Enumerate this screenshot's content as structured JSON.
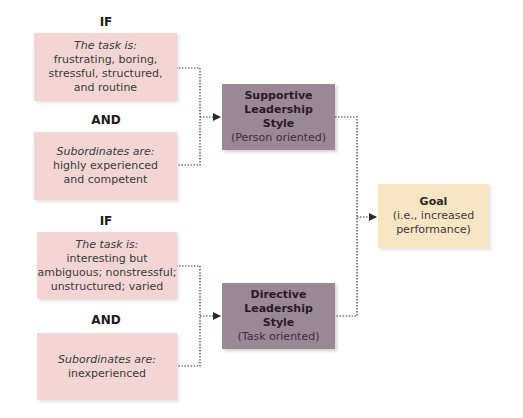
{
  "diagram": {
    "upper": {
      "if_label": "IF",
      "task_box": {
        "heading": "The task is:",
        "lines": [
          "frustrating, boring,",
          "stressful, structured,",
          "and routine"
        ]
      },
      "and_label": "AND",
      "subordinates_box": {
        "heading": "Subordinates are:",
        "lines": [
          "highly experienced",
          "and competent"
        ]
      }
    },
    "lower": {
      "if_label": "IF",
      "task_box": {
        "heading": "The task is:",
        "lines": [
          "interesting but",
          "ambiguous; nonstressful;",
          "unstructured; varied"
        ]
      },
      "and_label": "AND",
      "subordinates_box": {
        "heading": "Subordinates are:",
        "lines": [
          "inexperienced"
        ]
      }
    },
    "supportive": {
      "title_lines": [
        "Supportive",
        "Leadership",
        "Style"
      ],
      "subtitle": "(Person oriented)"
    },
    "directive": {
      "title_lines": [
        "Directive",
        "Leadership",
        "Style"
      ],
      "subtitle": "(Task oriented)"
    },
    "goal": {
      "title": "Goal",
      "lines": [
        "(i.e., increased",
        "performance)"
      ]
    },
    "colors": {
      "condition_box": "#f3d6d3",
      "style_box": "#9b8896",
      "goal_box": "#f8e5c3",
      "connector": "#3a3a3a"
    }
  }
}
